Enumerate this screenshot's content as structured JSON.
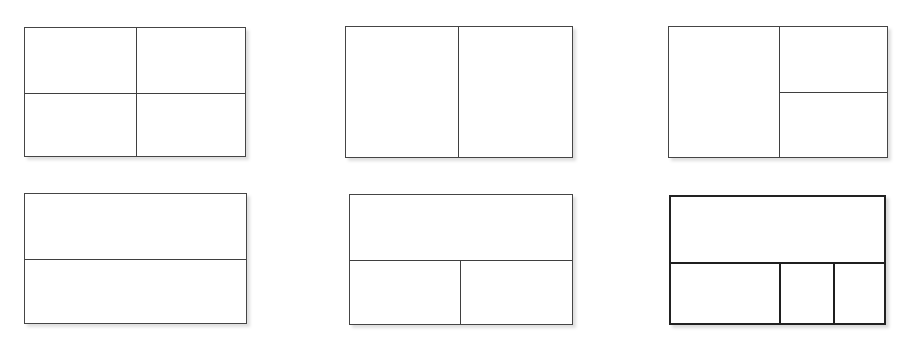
{
  "page": {
    "background_color": "#ffffff",
    "width": 916,
    "height": 345,
    "figure_count": 6
  },
  "style": {
    "line_color_thin": "#454545",
    "line_color_thick": "#222222",
    "fill_color": "#ffffff",
    "shadow_color": "rgba(0,0,0,0.14)",
    "shadow_offset_x": 3,
    "shadow_offset_y": 3
  },
  "figures": [
    {
      "id": "figure-1",
      "name": "quartered-rectangle",
      "label": "Rectangle split into four equal quadrants",
      "position": "top-left",
      "weight": "thin",
      "x": 24,
      "y": 27,
      "width": 222,
      "height": 130,
      "region_count": 4,
      "dividers": [
        {
          "name": "vertical-center-divider",
          "orientation": "vertical",
          "offset": 111,
          "span": "full"
        },
        {
          "name": "horizontal-center-divider",
          "orientation": "horizontal",
          "offset": 65,
          "span": "full"
        }
      ]
    },
    {
      "id": "figure-2",
      "name": "halved-vertically-rectangle",
      "label": "Rectangle split into two vertical halves",
      "position": "top-center",
      "weight": "thin",
      "x": 345,
      "y": 26,
      "width": 228,
      "height": 132,
      "region_count": 2,
      "dividers": [
        {
          "name": "vertical-center-divider",
          "orientation": "vertical",
          "offset": 112,
          "span": "full"
        }
      ]
    },
    {
      "id": "figure-3",
      "name": "left-half-right-quarters-rectangle",
      "label": "Rectangle split vertically, with the right half split horizontally",
      "position": "top-right",
      "weight": "thin",
      "x": 668,
      "y": 26,
      "width": 220,
      "height": 132,
      "region_count": 3,
      "dividers": [
        {
          "name": "vertical-center-divider",
          "orientation": "vertical",
          "offset": 110,
          "span": "full"
        },
        {
          "name": "right-half-horizontal-divider",
          "orientation": "horizontal",
          "offset": 65,
          "span": "right-half"
        }
      ]
    },
    {
      "id": "figure-4",
      "name": "halved-horizontally-rectangle",
      "label": "Rectangle split into two horizontal halves",
      "position": "bottom-left",
      "weight": "thin",
      "x": 24,
      "y": 193,
      "width": 223,
      "height": 131,
      "region_count": 2,
      "dividers": [
        {
          "name": "horizontal-center-divider",
          "orientation": "horizontal",
          "offset": 65,
          "span": "full"
        }
      ]
    },
    {
      "id": "figure-5",
      "name": "top-half-bottom-quarters-rectangle",
      "label": "Rectangle split horizontally, with the bottom half split vertically",
      "position": "bottom-center",
      "weight": "thin",
      "x": 349,
      "y": 194,
      "width": 224,
      "height": 131,
      "region_count": 3,
      "dividers": [
        {
          "name": "horizontal-center-divider",
          "orientation": "horizontal",
          "offset": 65,
          "span": "full"
        },
        {
          "name": "bottom-half-vertical-divider",
          "orientation": "vertical",
          "offset": 110,
          "span": "bottom-half"
        }
      ]
    },
    {
      "id": "figure-6",
      "name": "top-half-bottom-thirds-rectangle",
      "label": "Rectangle split horizontally, with the bottom half split into three unequal parts",
      "position": "bottom-right",
      "weight": "thick",
      "x": 669,
      "y": 195,
      "width": 217,
      "height": 130,
      "region_count": 4,
      "dividers": [
        {
          "name": "horizontal-center-divider",
          "orientation": "horizontal",
          "offset": 65,
          "span": "full"
        },
        {
          "name": "bottom-vertical-divider-left",
          "orientation": "vertical",
          "offset": 108,
          "span": "bottom-half"
        },
        {
          "name": "bottom-vertical-divider-right",
          "orientation": "vertical",
          "offset": 162,
          "span": "bottom-half"
        }
      ]
    }
  ]
}
